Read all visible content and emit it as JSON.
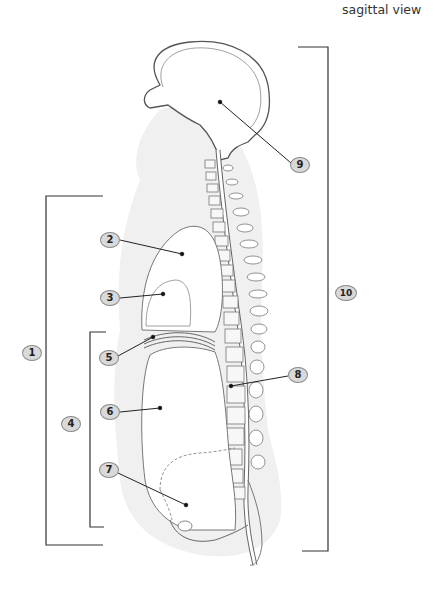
{
  "diagram": {
    "title": "sagittal view",
    "labels": [
      {
        "id": "1",
        "text": "1",
        "x": 22,
        "y": 345
      },
      {
        "id": "2",
        "text": "2",
        "x": 100,
        "y": 232
      },
      {
        "id": "3",
        "text": "3",
        "x": 100,
        "y": 290
      },
      {
        "id": "4",
        "text": "4",
        "x": 61,
        "y": 416
      },
      {
        "id": "5",
        "text": "5",
        "x": 100,
        "y": 350
      },
      {
        "id": "6",
        "text": "6",
        "x": 100,
        "y": 405
      },
      {
        "id": "7",
        "text": "7",
        "x": 100,
        "y": 462
      },
      {
        "id": "8",
        "text": "8",
        "x": 288,
        "y": 367
      },
      {
        "id": "9",
        "text": "9",
        "x": 290,
        "y": 157
      },
      {
        "id": "10",
        "text": "10",
        "x": 336,
        "y": 285
      }
    ],
    "colors": {
      "line": "#333333",
      "callout_fill": "#d9d9d9",
      "body_shadow": "#ececec",
      "organ_outline": "#777777"
    }
  }
}
